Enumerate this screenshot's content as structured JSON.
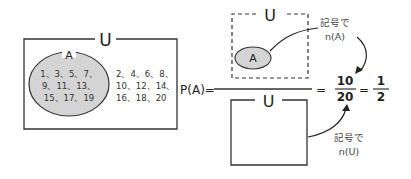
{
  "left_diagram": {
    "universe_label": "U",
    "set_label": "A",
    "set_a_numbers": [
      "1、3、5、7、",
      "9、11、13、",
      "15、17、19"
    ],
    "complement_numbers": [
      "2、4、6、8、",
      "10、12、14、",
      "16、18、20"
    ]
  },
  "formula": {
    "lhs": "P(A)=",
    "equals1": "=",
    "fraction1": {
      "numerator": "10",
      "denominator": "20"
    },
    "equals2": "=",
    "fraction2": {
      "numerator": "1",
      "denominator": "2"
    }
  },
  "numerator_diagram": {
    "universe_label": "U",
    "set_label": "A",
    "note_line1": "記号で",
    "note_line2": "n(A)"
  },
  "denominator_diagram": {
    "universe_label": "U",
    "note_line1": "記号で",
    "note_line2": "n(U)"
  },
  "colors": {
    "set_fill": "#d4d4d4",
    "stroke": "#333333"
  }
}
